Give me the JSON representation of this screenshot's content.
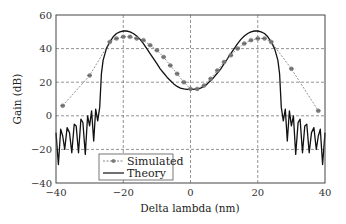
{
  "chart_data": {
    "type": "line",
    "title": "",
    "xlabel": "Delta lambda (nm)",
    "ylabel": "Gain (dB)",
    "xlim": [
      -40,
      40
    ],
    "ylim": [
      -40,
      60
    ],
    "xticks": [
      -40,
      -20,
      0,
      20,
      40
    ],
    "yticks": [
      -40,
      -20,
      0,
      20,
      40,
      60
    ],
    "xtick_labels": [
      "−40",
      "−20",
      "0",
      "20",
      "40"
    ],
    "ytick_labels": [
      "−40",
      "−20",
      "0",
      "20",
      "40",
      "60"
    ],
    "grid": true,
    "grid_style": "dashed",
    "legend_position": "lower-left-center",
    "series": [
      {
        "name": "Simulated",
        "style": "dashed-with-star-markers",
        "color": "#777777",
        "x": [
          -38,
          -30,
          -24,
          -22,
          -20,
          -18,
          -16,
          -14,
          -12,
          -10,
          -8,
          -6,
          -4,
          -2,
          0,
          2,
          4,
          6,
          8,
          10,
          12,
          14,
          16,
          18,
          20,
          22,
          24,
          30,
          38
        ],
        "y": [
          6,
          24,
          44,
          46,
          47,
          47,
          46,
          45,
          42,
          39,
          35,
          30,
          25,
          20,
          16,
          16,
          18,
          22,
          27,
          32,
          36,
          40,
          43,
          45,
          46,
          46,
          44,
          28,
          3
        ]
      },
      {
        "name": "Theory",
        "style": "solid",
        "color": "#111111",
        "x": [
          -40,
          -39.3,
          -38.6,
          -38,
          -37.4,
          -36.7,
          -36,
          -35.3,
          -34.6,
          -34,
          -33.3,
          -32.6,
          -32,
          -31.3,
          -30.6,
          -30,
          -29.4,
          -28.8,
          -28.2,
          -27.6,
          -27,
          -26.5,
          -26,
          -25,
          -24,
          -23,
          -22,
          -21,
          -20,
          -19,
          -18,
          -17,
          -16,
          -15,
          -14,
          -13,
          -12,
          -11,
          -10,
          -9,
          -8,
          -7,
          -6,
          -5,
          -4,
          -3,
          -2,
          -1,
          0,
          1,
          2,
          3,
          4,
          5,
          6,
          7,
          8,
          9,
          10,
          11,
          12,
          13,
          14,
          15,
          16,
          17,
          18,
          19,
          20,
          21,
          22,
          23,
          24,
          25,
          26,
          26.5,
          27,
          27.6,
          28.2,
          28.8,
          29.4,
          30,
          30.6,
          31.3,
          32,
          32.6,
          33.3,
          34,
          34.6,
          35.3,
          36,
          36.7,
          37.4,
          38,
          38.6,
          39.3,
          40
        ],
        "y": [
          -10,
          -29,
          -8,
          -12,
          -20,
          -7,
          -10,
          -22,
          -5,
          -6,
          -22,
          -2,
          -4,
          -23,
          0,
          -6,
          3,
          -15,
          4,
          -3,
          5,
          25,
          33,
          40,
          44,
          47,
          49,
          50,
          50.5,
          50.5,
          50,
          49,
          47.5,
          45.5,
          43,
          40,
          37,
          34,
          31,
          28,
          25.5,
          23,
          21,
          19,
          17.5,
          16.5,
          16,
          15.8,
          15.8,
          15.8,
          16,
          16.5,
          17.5,
          19,
          21,
          23,
          25.5,
          28,
          31,
          34,
          37,
          40,
          43,
          45.5,
          47.5,
          49,
          50,
          50.5,
          50.5,
          50,
          49,
          47,
          44,
          40,
          33,
          25,
          5,
          -3,
          4,
          -15,
          3,
          -6,
          0,
          -23,
          -4,
          -2,
          -22,
          -6,
          -5,
          -22,
          -10,
          -7,
          -20,
          -12,
          -8,
          -29,
          -10
        ]
      }
    ],
    "legend": {
      "entries": [
        "Simulated",
        "Theory"
      ]
    }
  },
  "layout": {
    "plot_left": 56,
    "plot_right": 325,
    "plot_top": 15,
    "plot_bottom": 183
  }
}
